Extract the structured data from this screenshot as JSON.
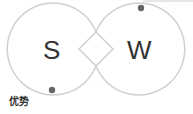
{
  "diagram": {
    "left_letter": "S",
    "right_letter": "W",
    "caption": "优势",
    "colors": {
      "stroke": "#cfcfcf",
      "dot": "#666666",
      "text": "#333333"
    }
  }
}
